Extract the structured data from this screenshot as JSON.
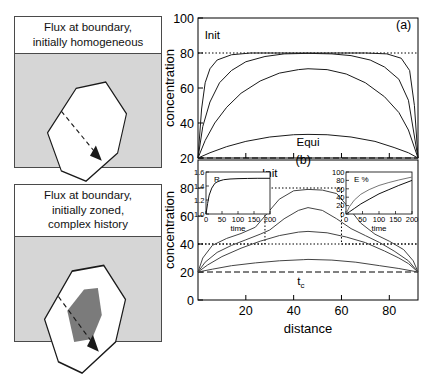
{
  "schematics": [
    {
      "id": "homogeneous",
      "caption_lines": [
        "Flux at boundary,",
        "initially homogeneous"
      ],
      "grain_fill": "#ffffff",
      "background_fill": "#d6d6d6",
      "arrow_style": "dashed-arrow",
      "zone_fill": null
    },
    {
      "id": "zoned",
      "caption_lines": [
        "Flux at boundary,",
        "initially zoned,",
        "complex history"
      ],
      "grain_fill": "#ffffff",
      "background_fill": "#d6d6d6",
      "arrow_style": "dashed-arrow",
      "zone_fill": "#7b7b7b"
    }
  ],
  "axes": {
    "x_label": "distance",
    "x_ticks": [
      20,
      40,
      60,
      80
    ],
    "x_min": 0,
    "x_max": 92,
    "y_label": "concentration"
  },
  "chart_data": [
    {
      "type": "line",
      "panel_label": "(a)",
      "title": "",
      "xlabel": "distance",
      "ylabel": "concentration",
      "xlim": [
        0,
        92
      ],
      "ylim": [
        20,
        100
      ],
      "y_ticks": [
        20,
        40,
        60,
        80,
        100
      ],
      "x_ticks": [
        20,
        40,
        60,
        80
      ],
      "grid": false,
      "legend": "none",
      "annotations": [
        {
          "text": "Init",
          "x": 6,
          "y": 88,
          "style": "plain"
        },
        {
          "text": "Equi",
          "x": 46,
          "y": 27,
          "style": "plain"
        },
        {
          "text": "(a)",
          "x": 86,
          "y": 94,
          "style": "panel"
        }
      ],
      "reference_lines": [
        {
          "name": "Init",
          "value": 80,
          "style": "dotted"
        },
        {
          "name": "Equi",
          "value": 20,
          "style": "dashed"
        }
      ],
      "series": [
        {
          "name": "t1",
          "comment": "earliest, nearly fully retained plateau at 80",
          "x": [
            0,
            1.5,
            3,
            5,
            8,
            14,
            22,
            35,
            46,
            58,
            70,
            79,
            85,
            88.5,
            90.5,
            92
          ],
          "values": [
            20,
            48,
            63,
            71,
            76,
            79,
            80,
            80,
            80,
            80,
            80,
            79.5,
            77,
            70,
            50,
            20
          ]
        },
        {
          "name": "t2",
          "x": [
            0,
            2,
            5,
            9,
            14,
            20,
            28,
            36,
            46,
            56,
            64,
            72,
            78,
            84,
            88,
            92
          ],
          "values": [
            20,
            38,
            52,
            63,
            70,
            75,
            78,
            79.5,
            79.8,
            79.5,
            78.5,
            76,
            72,
            65,
            53,
            20
          ]
        },
        {
          "name": "t3",
          "x": [
            0,
            3,
            7,
            12,
            18,
            26,
            34,
            42,
            46,
            54,
            62,
            70,
            78,
            84,
            88,
            92
          ],
          "values": [
            20,
            30,
            40,
            49,
            57,
            64,
            68.5,
            70.5,
            71,
            70.5,
            68,
            63,
            55,
            46,
            36,
            20
          ]
        },
        {
          "name": "t4",
          "x": [
            0,
            5,
            12,
            20,
            30,
            40,
            46,
            54,
            64,
            74,
            82,
            88,
            92
          ],
          "values": [
            20,
            23,
            26.5,
            29.5,
            32,
            33.3,
            33.5,
            33.3,
            32,
            29.5,
            26,
            23,
            20
          ]
        }
      ]
    },
    {
      "type": "line",
      "panel_label": "(b)",
      "title": "",
      "xlabel": "distance",
      "ylabel": "concentration",
      "xlim": [
        0,
        92
      ],
      "ylim": [
        0,
        100
      ],
      "y_ticks": [
        0,
        20,
        40,
        60,
        80
      ],
      "x_ticks": [
        20,
        40,
        60,
        80
      ],
      "grid": false,
      "legend": "none",
      "annotations": [
        {
          "text": "Init",
          "x": 30,
          "y": 88,
          "style": "plain"
        },
        {
          "text": "(b)",
          "x": 44,
          "y": 97,
          "style": "panel"
        },
        {
          "text": "tc",
          "x": 43,
          "y": 11,
          "style": "subscript",
          "base": "t",
          "sub": "c"
        }
      ],
      "reference_lines": [
        {
          "name": "Equi",
          "value": 20,
          "style": "dashed"
        },
        {
          "name": "OuterInit",
          "value": 40,
          "style": "dotted"
        }
      ],
      "initial_profile": {
        "name": "Init",
        "style": "dotted-step",
        "x": [
          0,
          28,
          28,
          60,
          60,
          92
        ],
        "values": [
          40,
          40,
          80,
          80,
          40,
          40
        ]
      },
      "series": [
        {
          "name": "t1",
          "x": [
            0,
            2,
            6,
            12,
            18,
            24,
            28,
            34,
            40,
            46,
            52,
            58,
            62,
            68,
            74,
            80,
            86,
            90,
            92
          ],
          "values": [
            20,
            30,
            39,
            44,
            47.5,
            52,
            60,
            72,
            78,
            79,
            78.5,
            76,
            68,
            55,
            47,
            42,
            36,
            28,
            20
          ]
        },
        {
          "name": "t2",
          "x": [
            0,
            3,
            8,
            14,
            20,
            26,
            30,
            36,
            42,
            46,
            52,
            58,
            64,
            70,
            76,
            82,
            88,
            92
          ],
          "values": [
            20,
            27,
            34,
            39,
            43,
            47,
            50,
            58,
            64,
            66,
            64,
            58,
            51,
            46,
            41,
            35,
            28,
            20
          ]
        },
        {
          "name": "t3",
          "x": [
            0,
            4,
            10,
            18,
            26,
            34,
            42,
            46,
            54,
            62,
            70,
            78,
            84,
            88,
            92
          ],
          "values": [
            20,
            25,
            31,
            37,
            42,
            46,
            48.5,
            49,
            48,
            45,
            41,
            35,
            30,
            26,
            20
          ]
        },
        {
          "name": "t4",
          "x": [
            0,
            6,
            14,
            24,
            34,
            44,
            46,
            56,
            66,
            76,
            84,
            92
          ],
          "values": [
            20,
            22,
            24.5,
            26.5,
            28,
            28.8,
            29,
            28.5,
            27,
            24.5,
            22.5,
            20
          ]
        }
      ],
      "insets": [
        {
          "id": "R-inset",
          "type": "line",
          "title": "R",
          "xlabel": "time",
          "ylabel": "",
          "xlim": [
            0,
            200
          ],
          "ylim": [
            1.0,
            1.6
          ],
          "x_ticks": [
            0,
            50,
            100,
            150,
            200
          ],
          "y_ticks": [
            1.0,
            1.2,
            1.4,
            1.6
          ],
          "series": [
            {
              "name": "R",
              "x": [
                0,
                5,
                10,
                18,
                28,
                40,
                55,
                75,
                100,
                130,
                160,
                200
              ],
              "values": [
                1.0,
                1.15,
                1.27,
                1.37,
                1.44,
                1.47,
                1.49,
                1.5,
                1.505,
                1.508,
                1.51,
                1.51
              ]
            }
          ]
        },
        {
          "id": "E-inset",
          "type": "line",
          "title": "E %",
          "xlabel": "time",
          "ylabel": "",
          "xlim": [
            0,
            200
          ],
          "ylim": [
            0,
            100
          ],
          "x_ticks": [
            0,
            50,
            100,
            150,
            200
          ],
          "y_ticks": [
            0,
            20,
            40,
            60,
            80,
            100
          ],
          "series": [
            {
              "name": "upper",
              "x": [
                0,
                10,
                25,
                45,
                70,
                100,
                130,
                160,
                200
              ],
              "values": [
                0,
                17,
                33,
                47,
                58,
                68,
                75,
                81,
                88
              ]
            },
            {
              "name": "lower",
              "x": [
                0,
                10,
                25,
                45,
                70,
                100,
                130,
                160,
                200
              ],
              "values": [
                0,
                5,
                13,
                24,
                35,
                48,
                58,
                68,
                80
              ]
            }
          ]
        }
      ]
    }
  ]
}
